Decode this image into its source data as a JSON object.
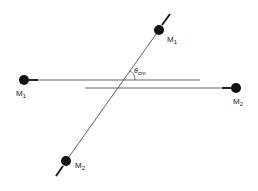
{
  "diagram": {
    "type": "collision-center-of-mass-frame",
    "scattering_angle_label": "θ",
    "scattering_angle_subscript": "cm",
    "particles": [
      {
        "id": "incoming-m1",
        "label": "M",
        "subscript": "1",
        "position": "left",
        "direction": "incoming"
      },
      {
        "id": "incoming-m2",
        "label": "M",
        "subscript": "2",
        "position": "right",
        "direction": "incoming"
      },
      {
        "id": "outgoing-m1",
        "label": "M",
        "subscript": "1",
        "position": "upper-right",
        "direction": "outgoing"
      },
      {
        "id": "outgoing-m2",
        "label": "M",
        "subscript": "2",
        "position": "lower-left",
        "direction": "outgoing"
      }
    ],
    "colors": {
      "line": "#3a3a3a",
      "ball": "#111111",
      "background": "#ffffff"
    }
  }
}
